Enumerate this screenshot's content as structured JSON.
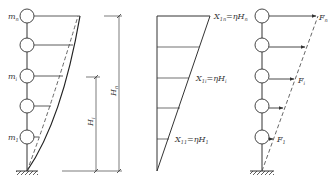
{
  "figure": {
    "panels": [
      {
        "id": "deformed-shape",
        "mass_labels": {
          "top": "m",
          "top_sub": "n",
          "mid": "m",
          "mid_sub": "i",
          "bottom": "m",
          "bottom_sub": "1"
        },
        "dimensions": {
          "hi": "H",
          "hi_sub": "i",
          "hn": "H",
          "hn_sub": "n"
        }
      },
      {
        "id": "displacement-distribution",
        "labels": {
          "top": "X",
          "top_sub": "1n",
          "top_eq": "=ηH",
          "top_eq_sub": "n",
          "mid": "X",
          "mid_sub": "1i",
          "mid_eq": "=ηH",
          "mid_eq_sub": "i",
          "bottom": "X",
          "bottom_sub": "11",
          "bottom_eq": "=ηH",
          "bottom_eq_sub": "1"
        }
      },
      {
        "id": "lateral-forces",
        "force_labels": {
          "top": "F",
          "top_sub": "n",
          "mid": "F",
          "mid_sub": "i",
          "bottom": "F",
          "bottom_sub": "1"
        }
      }
    ],
    "colors": {
      "line": "#333333",
      "dashed": "#555555"
    }
  }
}
